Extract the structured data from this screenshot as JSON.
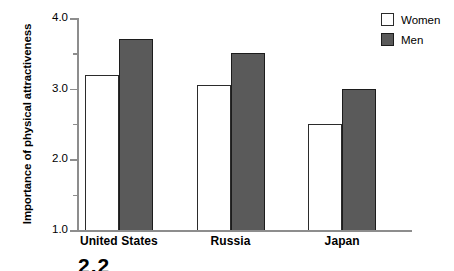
{
  "chart_data": {
    "type": "bar",
    "title": "",
    "xlabel": "",
    "ylabel": "Importance of physical attractiveness",
    "categories": [
      "United States",
      "Russia",
      "Japan"
    ],
    "series": [
      {
        "name": "Women",
        "values": [
          3.2,
          3.05,
          2.5
        ],
        "color": "#ffffff"
      },
      {
        "name": "Men",
        "values": [
          3.7,
          3.5,
          3.0
        ],
        "color": "#5a5a5a"
      }
    ],
    "ylim": [
      1.0,
      4.0
    ],
    "ytick_labels": [
      "4.0",
      "3.0",
      "2.0",
      "1.0"
    ],
    "ytick_values": [
      4.0,
      3.0,
      2.0,
      1.0
    ],
    "yminor_values": [
      3.5,
      2.5,
      1.5
    ],
    "grid": false,
    "legend_position": "top-right"
  },
  "legend": {
    "items": [
      {
        "label": "Women",
        "swatch": "women"
      },
      {
        "label": "Men",
        "swatch": "men"
      }
    ]
  },
  "caption": {
    "stub": "2.2"
  }
}
